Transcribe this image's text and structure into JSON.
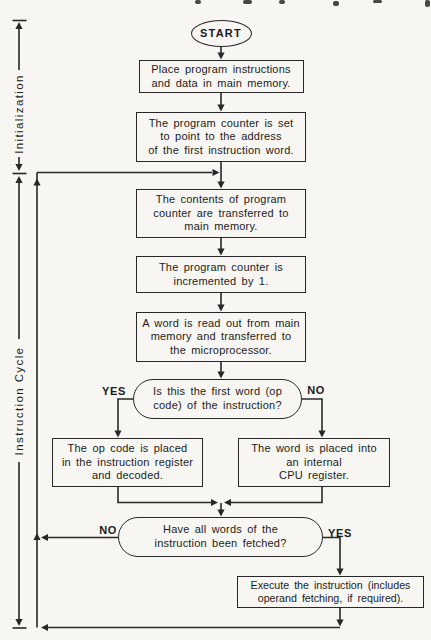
{
  "page": {
    "background": "#f7f6f2",
    "ink": "#282828"
  },
  "brackets": {
    "initialization": "Initialization",
    "instruction_cycle": "Instruction Cycle"
  },
  "nodes": {
    "start": {
      "label": "START"
    },
    "load_program": {
      "lines": [
        "Place program instructions",
        "and data in main memory."
      ]
    },
    "set_pc": {
      "lines": [
        "The program counter is set",
        "to point to the address",
        "of the first instruction word."
      ]
    },
    "pc_to_memory": {
      "lines": [
        "The contents of program",
        "counter are transferred to",
        "main memory."
      ]
    },
    "increment_pc": {
      "lines": [
        "The program counter is",
        "incremented by 1."
      ]
    },
    "read_word": {
      "lines": [
        "A word is read out from main",
        "memory and transferred to",
        "the microprocessor."
      ]
    },
    "is_first_word": {
      "lines": [
        "Is this the first word (op",
        "code) of the instruction?"
      ],
      "yes": "YES",
      "no": "NO"
    },
    "opcode_to_ir": {
      "lines": [
        "The op code is placed",
        "in the instruction register",
        "and decoded."
      ]
    },
    "word_to_register": {
      "lines": [
        "The word is placed into",
        "an internal",
        "CPU register."
      ]
    },
    "all_words_fetched": {
      "lines": [
        "Have all words of the",
        "instruction been fetched?"
      ],
      "no": "NO",
      "yes": "YES"
    },
    "execute": {
      "lines": [
        "Execute the instruction (includes",
        "operand fetching, if required)."
      ]
    }
  }
}
